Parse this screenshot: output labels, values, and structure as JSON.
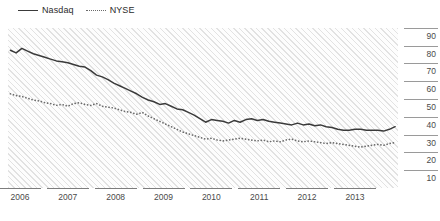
{
  "chart_data": {
    "type": "line",
    "title": "",
    "subtitle": "",
    "xlabel": "",
    "ylabel": "",
    "xlim": [
      2005.75,
      2013.9
    ],
    "ylim": [
      5,
      95
    ],
    "yticks": [
      90,
      80,
      70,
      60,
      50,
      40,
      30,
      20,
      10
    ],
    "xticks": [
      2006,
      2007,
      2008,
      2009,
      2010,
      2011,
      2012,
      2013
    ],
    "xtick_labels": [
      "2006",
      "2007",
      "2008",
      "2009",
      "2010",
      "2011",
      "2012",
      "2013"
    ],
    "grid": false,
    "legend_position": "top-left",
    "background": "diagonal-hatch",
    "series": [
      {
        "name": "Nasdaq",
        "style": "solid",
        "color": "#3a3a3a",
        "x": [
          2005.8,
          2005.92,
          2006.04,
          2006.16,
          2006.28,
          2006.4,
          2006.52,
          2006.64,
          2006.76,
          2006.88,
          2007.0,
          2007.12,
          2007.24,
          2007.36,
          2007.48,
          2007.6,
          2007.72,
          2007.84,
          2007.96,
          2008.08,
          2008.2,
          2008.32,
          2008.44,
          2008.56,
          2008.68,
          2008.8,
          2008.92,
          2009.04,
          2009.16,
          2009.28,
          2009.4,
          2009.52,
          2009.64,
          2009.76,
          2009.88,
          2010.0,
          2010.12,
          2010.24,
          2010.36,
          2010.48,
          2010.6,
          2010.72,
          2010.84,
          2010.96,
          2011.08,
          2011.2,
          2011.32,
          2011.44,
          2011.56,
          2011.68,
          2011.8,
          2011.92,
          2012.04,
          2012.16,
          2012.28,
          2012.4,
          2012.52,
          2012.64,
          2012.76,
          2012.88,
          2013.0,
          2013.12,
          2013.24,
          2013.36,
          2013.48,
          2013.6,
          2013.72,
          2013.84
        ],
        "values": [
          82.5,
          81.0,
          83.5,
          82.0,
          80.5,
          79.5,
          78.5,
          77.5,
          76.5,
          76.0,
          75.5,
          74.5,
          73.5,
          73.0,
          71.0,
          68.5,
          67.5,
          66.0,
          64.0,
          62.5,
          61.0,
          59.5,
          58.0,
          56.0,
          54.5,
          53.5,
          52.0,
          52.5,
          51.0,
          49.5,
          49.0,
          47.5,
          46.0,
          44.0,
          42.0,
          43.5,
          43.0,
          42.5,
          41.5,
          43.0,
          42.0,
          43.5,
          44.0,
          43.0,
          43.5,
          42.5,
          42.0,
          41.5,
          41.0,
          40.5,
          41.5,
          40.5,
          41.0,
          40.0,
          40.5,
          39.5,
          39.0,
          38.0,
          37.5,
          37.5,
          38.0,
          38.0,
          37.5,
          37.5,
          37.5,
          37.0,
          38.0,
          39.5
        ]
      },
      {
        "name": "NYSE",
        "style": "dotted",
        "color": "#6b6b6b",
        "x": [
          2005.8,
          2005.92,
          2006.04,
          2006.16,
          2006.28,
          2006.4,
          2006.52,
          2006.64,
          2006.76,
          2006.88,
          2007.0,
          2007.12,
          2007.24,
          2007.36,
          2007.48,
          2007.6,
          2007.72,
          2007.84,
          2007.96,
          2008.08,
          2008.2,
          2008.32,
          2008.44,
          2008.56,
          2008.68,
          2008.8,
          2008.92,
          2009.04,
          2009.16,
          2009.28,
          2009.4,
          2009.52,
          2009.64,
          2009.76,
          2009.88,
          2010.0,
          2010.12,
          2010.24,
          2010.36,
          2010.48,
          2010.6,
          2010.72,
          2010.84,
          2010.96,
          2011.08,
          2011.2,
          2011.32,
          2011.44,
          2011.56,
          2011.68,
          2011.8,
          2011.92,
          2012.04,
          2012.16,
          2012.28,
          2012.4,
          2012.52,
          2012.64,
          2012.76,
          2012.88,
          2013.0,
          2013.12,
          2013.24,
          2013.36,
          2013.48,
          2013.6,
          2013.72,
          2013.84
        ],
        "values": [
          58.0,
          57.0,
          56.5,
          55.5,
          54.5,
          54.0,
          53.0,
          52.5,
          51.5,
          52.0,
          51.0,
          52.5,
          53.0,
          52.0,
          51.5,
          52.5,
          51.0,
          50.5,
          50.0,
          49.0,
          48.0,
          47.5,
          46.5,
          47.5,
          45.5,
          44.0,
          42.5,
          41.0,
          39.5,
          38.0,
          36.5,
          35.5,
          34.5,
          33.5,
          32.5,
          33.0,
          32.0,
          31.5,
          32.0,
          32.5,
          33.0,
          32.5,
          32.0,
          31.5,
          32.0,
          31.0,
          31.5,
          31.0,
          32.0,
          32.5,
          31.5,
          31.0,
          31.5,
          31.0,
          30.5,
          30.0,
          30.5,
          30.0,
          29.5,
          29.0,
          28.5,
          28.0,
          28.5,
          29.0,
          29.5,
          29.0,
          30.0,
          30.5
        ]
      }
    ]
  },
  "legend": {
    "items": [
      {
        "label": "Nasdaq",
        "style": "solid"
      },
      {
        "label": "NYSE",
        "style": "dotted"
      }
    ]
  }
}
